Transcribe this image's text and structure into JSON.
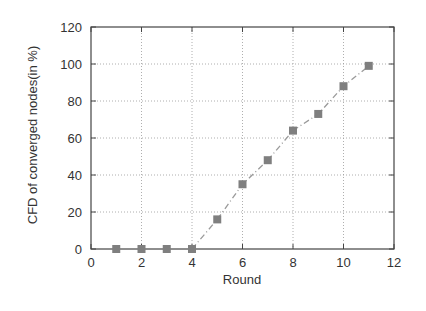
{
  "chart_data": {
    "type": "line",
    "title": "",
    "xlabel": "Round",
    "ylabel": "CFD of converged nodes(in %)",
    "xlim": [
      0,
      12
    ],
    "ylim": [
      0,
      120
    ],
    "xticks": [
      0,
      2,
      4,
      6,
      8,
      10,
      12
    ],
    "yticks": [
      0,
      20,
      40,
      60,
      80,
      100,
      120
    ],
    "grid": true,
    "legend": null,
    "series": [
      {
        "name": "CFD",
        "marker": "square",
        "line_style": "dash-dot",
        "color": "#8a8a8a",
        "x": [
          1,
          2,
          3,
          4,
          5,
          6,
          7,
          8,
          9,
          10,
          11
        ],
        "y": [
          0,
          0,
          0,
          0,
          16,
          35,
          48,
          64,
          73,
          88,
          99
        ]
      }
    ]
  },
  "colors": {
    "axis": "#444444",
    "grid": "#9a9a9a",
    "marker": "#7f7f7f",
    "line": "#9a9a9a"
  }
}
